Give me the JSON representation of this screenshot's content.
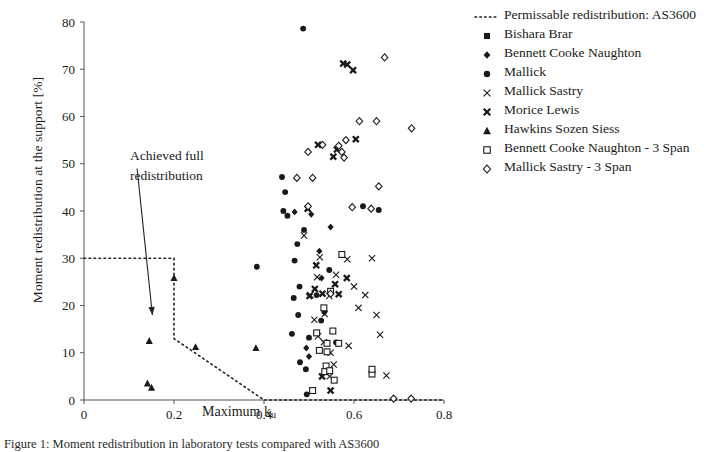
{
  "figure": {
    "y_axis_label": "Moment redistribution at the support [%]",
    "x_axis_label_main": "Maximum k",
    "x_axis_label_sub": "u",
    "annotation": {
      "line1": "Achieved full",
      "line2": "redistribution"
    },
    "caption": "Figure 1: Moment redistribution in laboratory tests compared with AS3600"
  },
  "legend": {
    "items": [
      {
        "label": "Permissable redistribution: AS3600",
        "marker": "dotted-line"
      },
      {
        "label": "Bishara Brar",
        "marker": "filled-square"
      },
      {
        "label": "Bennett Cooke Naughton",
        "marker": "filled-diamond"
      },
      {
        "label": "Mallick",
        "marker": "filled-circle"
      },
      {
        "label": "Mallick Sastry",
        "marker": "thin-cross"
      },
      {
        "label": "Morice Lewis",
        "marker": "bold-cross"
      },
      {
        "label": "Hawkins Sozen Siess",
        "marker": "filled-triangle"
      },
      {
        "label": "Bennett Cooke Naughton - 3 Span",
        "marker": "open-square"
      },
      {
        "label": "Mallick Sastry - 3 Span",
        "marker": "open-diamond"
      }
    ]
  },
  "chart_data": {
    "type": "scatter",
    "title": "",
    "xlabel": "Maximum ku",
    "ylabel": "Moment redistribution at the support [%]",
    "xlim": [
      0,
      0.8
    ],
    "ylim": [
      0,
      80
    ],
    "xticks": [
      0,
      0.2,
      0.4,
      0.6,
      0.8
    ],
    "xtick_labels": [
      "0",
      "0.2",
      "0.4",
      "0.6",
      "0.8"
    ],
    "yticks": [
      0,
      10,
      20,
      30,
      40,
      50,
      60,
      70,
      80
    ],
    "ytick_labels": [
      "0",
      "10",
      "20",
      "30",
      "40",
      "50",
      "60",
      "70",
      "80"
    ],
    "grid": false,
    "legend_position": "right",
    "reference_line": {
      "name": "Permissable redistribution: AS3600",
      "style": "dotted",
      "points": [
        [
          0.0,
          30
        ],
        [
          0.2,
          30
        ],
        [
          0.2,
          13
        ],
        [
          0.4,
          0
        ],
        [
          0.8,
          0
        ]
      ]
    },
    "annotation_arrow": {
      "text": "Achieved full redistribution",
      "from": [
        0.118,
        49
      ],
      "to": [
        0.152,
        18
      ]
    },
    "series": [
      {
        "name": "Bishara Brar",
        "marker": "filled-square",
        "points": []
      },
      {
        "name": "Bennett Cooke Naughton",
        "marker": "filled-diamond",
        "points": [
          [
            0.468,
            39.8
          ],
          [
            0.505,
            39.3
          ],
          [
            0.523,
            31.5
          ],
          [
            0.548,
            36.6
          ],
          [
            0.528,
            25.8
          ],
          [
            0.534,
            18.5
          ],
          [
            0.494,
            11.0
          ],
          [
            0.5,
            9.2
          ]
        ]
      },
      {
        "name": "Mallick",
        "marker": "filled-circle",
        "points": [
          [
            0.487,
            78.6
          ],
          [
            0.44,
            47.2
          ],
          [
            0.447,
            44.0
          ],
          [
            0.443,
            40.0
          ],
          [
            0.452,
            39.0
          ],
          [
            0.384,
            28.2
          ],
          [
            0.489,
            36.0
          ],
          [
            0.474,
            33.0
          ],
          [
            0.468,
            29.5
          ],
          [
            0.479,
            24.0
          ],
          [
            0.466,
            21.6
          ],
          [
            0.476,
            18.0
          ],
          [
            0.462,
            14.0
          ],
          [
            0.5,
            13.2
          ],
          [
            0.517,
            22.2
          ],
          [
            0.545,
            27.5
          ],
          [
            0.527,
            16.8
          ],
          [
            0.56,
            12.2
          ],
          [
            0.48,
            8.0
          ],
          [
            0.493,
            6.5
          ],
          [
            0.495,
            1.2
          ],
          [
            0.62,
            41.0
          ],
          [
            0.655,
            40.2
          ]
        ]
      },
      {
        "name": "Mallick Sastry",
        "marker": "thin-cross",
        "points": [
          [
            0.489,
            34.8
          ],
          [
            0.524,
            30.2
          ],
          [
            0.518,
            26.0
          ],
          [
            0.56,
            26.5
          ],
          [
            0.503,
            22.2
          ],
          [
            0.545,
            22.0
          ],
          [
            0.535,
            18.2
          ],
          [
            0.512,
            17.0
          ],
          [
            0.52,
            13.5
          ],
          [
            0.533,
            12.2
          ],
          [
            0.548,
            10.0
          ],
          [
            0.585,
            29.8
          ],
          [
            0.6,
            24.0
          ],
          [
            0.61,
            19.5
          ],
          [
            0.625,
            22.2
          ],
          [
            0.64,
            30.0
          ],
          [
            0.65,
            18.0
          ],
          [
            0.658,
            13.8
          ],
          [
            0.672,
            5.2
          ],
          [
            0.588,
            11.5
          ],
          [
            0.555,
            7.5
          ],
          [
            0.546,
            5.0
          ]
        ]
      },
      {
        "name": "Morice Lewis",
        "marker": "bold-cross",
        "points": [
          [
            0.576,
            71.2
          ],
          [
            0.585,
            71.0
          ],
          [
            0.598,
            69.8
          ],
          [
            0.604,
            55.2
          ],
          [
            0.497,
            40.5
          ],
          [
            0.52,
            54.0
          ],
          [
            0.554,
            51.5
          ],
          [
            0.562,
            53.0
          ],
          [
            0.501,
            22.0
          ],
          [
            0.513,
            23.5
          ],
          [
            0.53,
            22.5
          ],
          [
            0.558,
            24.5
          ],
          [
            0.566,
            22.4
          ],
          [
            0.584,
            25.8
          ],
          [
            0.529,
            5.0
          ],
          [
            0.516,
            28.5
          ],
          [
            0.548,
            2.0
          ]
        ]
      },
      {
        "name": "Hawkins Sozen Siess",
        "marker": "filled-triangle",
        "points": [
          [
            0.145,
            12.5
          ],
          [
            0.141,
            3.5
          ],
          [
            0.15,
            2.6
          ],
          [
            0.2,
            25.8
          ],
          [
            0.248,
            11.2
          ],
          [
            0.382,
            11.0
          ]
        ]
      },
      {
        "name": "Bennett Cooke Naughton - 3 Span",
        "marker": "open-square",
        "points": [
          [
            0.548,
            23.0
          ],
          [
            0.533,
            19.5
          ],
          [
            0.517,
            14.2
          ],
          [
            0.553,
            14.6
          ],
          [
            0.54,
            12.0
          ],
          [
            0.523,
            10.5
          ],
          [
            0.54,
            10.2
          ],
          [
            0.538,
            7.2
          ],
          [
            0.535,
            6.0
          ],
          [
            0.546,
            6.2
          ],
          [
            0.556,
            4.2
          ],
          [
            0.508,
            2.0
          ],
          [
            0.573,
            30.8
          ],
          [
            0.566,
            12.0
          ],
          [
            0.64,
            5.5
          ],
          [
            0.64,
            6.5
          ]
        ]
      },
      {
        "name": "Mallick Sastry - 3 Span",
        "marker": "open-diamond",
        "points": [
          [
            0.566,
            53.8
          ],
          [
            0.573,
            52.5
          ],
          [
            0.578,
            51.3
          ],
          [
            0.582,
            55.0
          ],
          [
            0.53,
            54.0
          ],
          [
            0.508,
            47.0
          ],
          [
            0.498,
            52.5
          ],
          [
            0.473,
            47.0
          ],
          [
            0.498,
            41.0
          ],
          [
            0.612,
            59.0
          ],
          [
            0.65,
            59.0
          ],
          [
            0.728,
            57.5
          ],
          [
            0.668,
            72.5
          ],
          [
            0.596,
            40.8
          ],
          [
            0.638,
            40.5
          ],
          [
            0.655,
            45.2
          ],
          [
            0.548,
            22.5
          ],
          [
            0.688,
            0.3
          ],
          [
            0.727,
            0.3
          ]
        ]
      }
    ]
  }
}
